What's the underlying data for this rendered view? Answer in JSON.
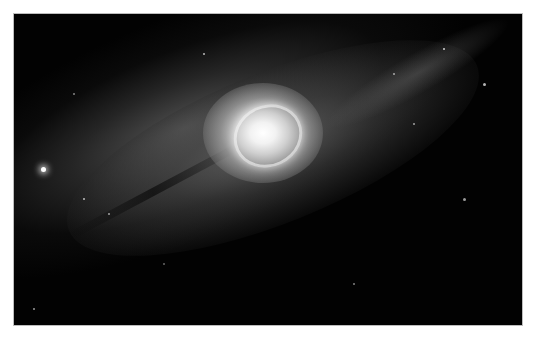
{
  "image": {
    "subject": "spiral galaxy",
    "description": "Grayscale photograph of a barred spiral galaxy seen at an angle, bright white core with spiral arms extending diagonally from lower-left to upper-right against a black starfield",
    "colors": {
      "background": "#ffffff",
      "space": "#020202",
      "core": "#ffffff",
      "disk": "#7a7a7a"
    }
  }
}
